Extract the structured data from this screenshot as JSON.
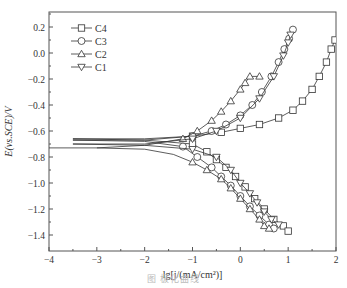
{
  "chart_data": {
    "type": "line",
    "title": "",
    "xlabel": "lg[j/(mA/cm²)]",
    "ylabel": "E(vs.SCE)/V",
    "xlim": [
      -4,
      2
    ],
    "ylim": [
      -1.52,
      0.3
    ],
    "xticks": [
      -4,
      -3,
      -2,
      -1,
      0,
      1,
      2
    ],
    "yticks": [
      -1.4,
      -1.2,
      -1.0,
      -0.8,
      -0.6,
      -0.4,
      -0.2,
      0.0,
      0.2
    ],
    "xtick_labels": [
      "−4",
      "−3",
      "−2",
      "−1",
      "0",
      "1",
      "2"
    ],
    "ytick_labels": [
      "−1.4",
      "−1.2",
      "−1.0",
      "−0.8",
      "−0.6",
      "−0.4",
      "−0.2",
      "0.0",
      "0.2"
    ],
    "grid": false,
    "legend_position": "upper-left",
    "series": [
      {
        "name": "C4",
        "marker": "square",
        "anodic": {
          "x": [
            -3.5,
            -2.0,
            -1.0,
            -0.4,
            0.0,
            0.4,
            0.8,
            1.1,
            1.3,
            1.5,
            1.65,
            1.8,
            1.9,
            1.98
          ],
          "y": [
            -0.66,
            -0.66,
            -0.64,
            -0.61,
            -0.58,
            -0.55,
            -0.5,
            -0.44,
            -0.37,
            -0.28,
            -0.18,
            -0.07,
            0.03,
            0.1
          ]
        },
        "cathodic": {
          "x": [
            -3.5,
            -2.0,
            -1.0,
            -0.7,
            -0.5,
            -0.3,
            -0.1,
            0.1,
            0.3,
            0.5,
            0.7,
            0.9,
            1.0
          ],
          "y": [
            -0.66,
            -0.67,
            -0.7,
            -0.76,
            -0.82,
            -0.88,
            -0.95,
            -1.03,
            -1.12,
            -1.2,
            -1.28,
            -1.33,
            -1.37
          ]
        }
      },
      {
        "name": "C3",
        "marker": "circle",
        "anodic": {
          "x": [
            -3.5,
            -2.0,
            -1.0,
            -0.6,
            -0.3,
            0.0,
            0.25,
            0.45,
            0.65,
            0.8,
            0.92,
            1.02,
            1.1
          ],
          "y": [
            -0.67,
            -0.67,
            -0.64,
            -0.6,
            -0.55,
            -0.48,
            -0.4,
            -0.3,
            -0.18,
            -0.07,
            0.03,
            0.11,
            0.18
          ]
        },
        "cathodic": {
          "x": [
            -3.5,
            -2.0,
            -1.2,
            -0.9,
            -0.6,
            -0.4,
            -0.2,
            0.0,
            0.2,
            0.4,
            0.6,
            0.7
          ],
          "y": [
            -0.67,
            -0.68,
            -0.72,
            -0.8,
            -0.88,
            -0.95,
            -1.02,
            -1.1,
            -1.18,
            -1.25,
            -1.32,
            -1.35
          ]
        }
      },
      {
        "name": "C2",
        "marker": "triangle-up",
        "anodic": {
          "x": [
            -4.0,
            -3.0,
            -2.0,
            -1.2,
            -0.9,
            -0.6,
            -0.4,
            -0.2,
            0.0,
            0.1,
            0.2,
            0.4
          ],
          "y": [
            -0.73,
            -0.73,
            -0.71,
            -0.66,
            -0.6,
            -0.52,
            -0.45,
            -0.37,
            -0.28,
            -0.23,
            -0.18,
            -0.18
          ]
        },
        "cathodic": {
          "x": [
            -3.0,
            -2.0,
            -1.4,
            -1.0,
            -0.7,
            -0.4,
            -0.2,
            0.0,
            0.2,
            0.4,
            0.5,
            0.6
          ],
          "y": [
            -0.73,
            -0.74,
            -0.78,
            -0.84,
            -0.9,
            -0.97,
            -1.04,
            -1.12,
            -1.2,
            -1.28,
            -1.33,
            -1.35
          ]
        }
      },
      {
        "name": "C1",
        "marker": "triangle-down",
        "anodic": {
          "x": [
            -3.5,
            -2.0,
            -1.0,
            -0.5,
            0.0,
            0.4,
            0.7,
            0.9,
            1.0,
            1.05
          ],
          "y": [
            -0.7,
            -0.7,
            -0.66,
            -0.6,
            -0.5,
            -0.35,
            -0.18,
            -0.02,
            0.08,
            0.14
          ]
        },
        "cathodic": {
          "x": [
            -3.5,
            -2.0,
            -1.0,
            -0.5,
            -0.2,
            0.0,
            0.2,
            0.35,
            0.5,
            0.65,
            0.8
          ],
          "y": [
            -0.7,
            -0.71,
            -0.74,
            -0.8,
            -0.9,
            -1.0,
            -1.08,
            -1.15,
            -1.22,
            -1.28,
            -1.32
          ]
        }
      }
    ]
  },
  "legend": {
    "items": [
      {
        "label": "C4",
        "marker": "square"
      },
      {
        "label": "C3",
        "marker": "circle"
      },
      {
        "label": "C2",
        "marker": "triangle-up"
      },
      {
        "label": "C1",
        "marker": "triangle-down"
      }
    ]
  },
  "axes": {
    "xlabel": "lg[j/(mA/cm²)]",
    "ylabel": "E(vs.SCE)/V"
  },
  "caption": "图  极化曲线"
}
